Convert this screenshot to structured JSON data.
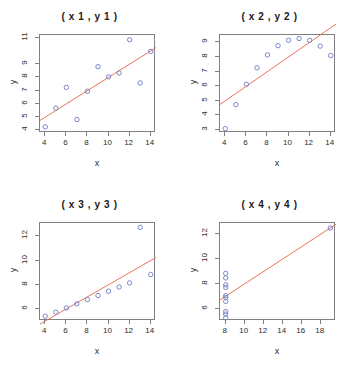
{
  "figure": {
    "point_color": "#7b88c8",
    "line_color": "#e8745a",
    "axis_color": "#808080",
    "background": "#ffffff"
  },
  "chart_data": [
    {
      "type": "scatter",
      "title": "( x 1 , y 1 )",
      "xlabel": "x",
      "ylabel": "y",
      "x": [
        10,
        8,
        13,
        9,
        11,
        14,
        6,
        4,
        12,
        7,
        5
      ],
      "y": [
        8.04,
        6.95,
        7.58,
        8.81,
        8.33,
        9.96,
        7.24,
        4.26,
        10.84,
        4.82,
        5.68
      ],
      "xlim": [
        3.5,
        14.5
      ],
      "ylim": [
        3.8,
        11.2
      ],
      "xticks": [
        4,
        6,
        8,
        10,
        12,
        14
      ],
      "yticks": [
        4,
        5,
        6,
        7,
        8,
        9,
        11
      ],
      "grid": false,
      "fit_line": {
        "intercept": 3.0,
        "slope": 0.5
      }
    },
    {
      "type": "scatter",
      "title": "( x 2 , y 2 )",
      "xlabel": "x",
      "ylabel": "y",
      "x": [
        10,
        8,
        13,
        9,
        11,
        14,
        6,
        4,
        12,
        7,
        5
      ],
      "y": [
        9.14,
        8.14,
        8.74,
        8.77,
        9.26,
        8.1,
        6.13,
        3.1,
        9.13,
        7.26,
        4.74
      ],
      "xlim": [
        3.5,
        14.5
      ],
      "ylim": [
        2.8,
        9.5
      ],
      "xticks": [
        4,
        6,
        8,
        10,
        12,
        14
      ],
      "yticks": [
        3,
        4,
        5,
        6,
        7,
        8,
        9
      ],
      "grid": false,
      "fit_line": {
        "intercept": 3.0,
        "slope": 0.5
      }
    },
    {
      "type": "scatter",
      "title": "( x 3 , y 3 )",
      "xlabel": "x",
      "ylabel": "y",
      "x": [
        10,
        8,
        13,
        9,
        11,
        14,
        6,
        4,
        12,
        7,
        5
      ],
      "y": [
        7.46,
        6.77,
        12.74,
        7.11,
        7.81,
        8.84,
        6.08,
        5.39,
        8.15,
        6.42,
        5.73
      ],
      "xlim": [
        3.5,
        14.5
      ],
      "ylim": [
        5.0,
        13.1
      ],
      "xticks": [
        4,
        6,
        8,
        10,
        12,
        14
      ],
      "yticks": [
        6,
        8,
        10,
        12
      ],
      "grid": false,
      "fit_line": {
        "intercept": 3.0,
        "slope": 0.5
      }
    },
    {
      "type": "scatter",
      "title": "( x 4 , y 4 )",
      "xlabel": "x",
      "ylabel": "y",
      "x": [
        8,
        8,
        8,
        8,
        8,
        8,
        8,
        19,
        8,
        8,
        8
      ],
      "y": [
        6.58,
        5.76,
        7.71,
        8.84,
        8.47,
        7.04,
        5.25,
        12.5,
        5.56,
        7.91,
        6.89
      ],
      "xlim": [
        7.4,
        19.6
      ],
      "ylim": [
        5.0,
        12.9
      ],
      "xticks": [
        8,
        10,
        12,
        14,
        16,
        18
      ],
      "yticks": [
        6,
        8,
        10,
        12
      ],
      "grid": false,
      "fit_line": {
        "intercept": 3.0,
        "slope": 0.5
      }
    }
  ]
}
